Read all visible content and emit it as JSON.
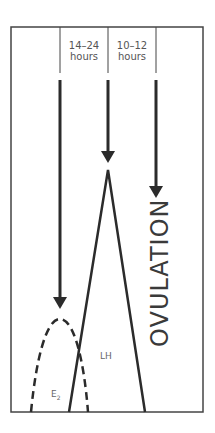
{
  "diagram": {
    "intervals": [
      {
        "line1": "14–24",
        "line2": "hours"
      },
      {
        "line1": "10–12",
        "line2": "hours"
      }
    ],
    "event_label": "OVULATION",
    "curves": {
      "lh": {
        "label": "LH",
        "style": "solid"
      },
      "e2": {
        "label": "E",
        "subscript": "2",
        "style": "dashed"
      }
    },
    "colors": {
      "line": "#2b2b2b",
      "frame": "#444444",
      "text": "#555555"
    }
  }
}
